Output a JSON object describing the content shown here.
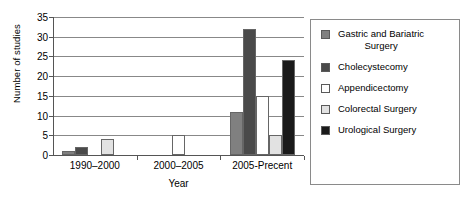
{
  "chart_data": {
    "type": "bar",
    "title": "",
    "xlabel": "Year",
    "ylabel": "Number of studies",
    "categories": [
      "1990–2000",
      "2000–2005",
      "2005-Precent"
    ],
    "series": [
      {
        "name": "Gastric and Bariatric Surgery",
        "name_line1": "Gastric and Bariatric",
        "name_line2": "Surgery",
        "color": "#808080",
        "values": [
          1,
          0,
          11
        ]
      },
      {
        "name": "Cholecystecomy",
        "color": "#4a4a4a",
        "values": [
          2,
          0,
          32
        ]
      },
      {
        "name": "Appendicectomy",
        "color": "#ffffff",
        "values": [
          0,
          5,
          15
        ]
      },
      {
        "name": "Colorectal Surgery",
        "color": "#e2e2e2",
        "values": [
          4,
          0,
          5
        ]
      },
      {
        "name": "Urological Surgery",
        "color": "#1a1a1a",
        "values": [
          0,
          0,
          24
        ]
      }
    ],
    "ylim": [
      0,
      35
    ],
    "ytick_step": 5,
    "yticks": [
      0,
      5,
      10,
      15,
      20,
      25,
      30,
      35
    ],
    "grid": true,
    "legend_position": "right"
  }
}
